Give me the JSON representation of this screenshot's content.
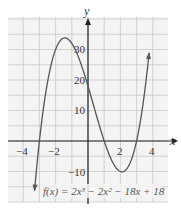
{
  "chart_data": {
    "type": "line",
    "title": "",
    "xlabel": "x",
    "ylabel": "y",
    "xlim": [
      -5,
      5
    ],
    "ylim": [
      -15,
      45
    ],
    "grid": true,
    "x_ticks": [
      -4,
      -2,
      2,
      4
    ],
    "y_ticks": [
      -10,
      10,
      20,
      30
    ],
    "x_tick_labels": [
      "−4",
      "−2",
      "2",
      "4"
    ],
    "y_tick_labels": [
      "−10",
      "10",
      "20",
      "30"
    ],
    "annotation": "f(x) = 2x³ − 2x² − 18x + 18",
    "series": [
      {
        "name": "f(x) = 2x^3 - 2x^2 - 18x + 18",
        "coefficients": [
          2,
          -2,
          -18,
          18
        ],
        "x": [
          -3.3,
          -3,
          -2.5,
          -2,
          -1.431,
          -1,
          -0.5,
          0,
          0.5,
          1,
          1.5,
          2,
          2.097,
          2.5,
          3,
          3.5,
          3.75
        ],
        "y": [
          -9.1,
          0,
          15.75,
          30,
          33.8,
          32,
          25.25,
          18,
          9.75,
          0,
          -7.5,
          -10,
          -10.1,
          -6.75,
          0,
          11.25,
          19.1
        ]
      }
    ],
    "key_points": {
      "local_max": {
        "x": -1.43,
        "y": 33.8
      },
      "local_min": {
        "x": 2.1,
        "y": -10.1
      },
      "roots": [
        -3,
        1,
        3
      ],
      "y_intercept": 18
    }
  },
  "labels": {
    "x_axis": "x",
    "y_axis": "y",
    "function": "f(x) = 2x³ − 2x² − 18x + 18",
    "x_ticks": [
      "−4",
      "−2",
      "2",
      "4"
    ],
    "y_ticks": [
      "30",
      "20",
      "10",
      "−10"
    ]
  },
  "colors": {
    "curve": "#555555",
    "axis": "#222222",
    "grid": "#c8c8c8",
    "grid_bg": "#f4f4f4"
  }
}
